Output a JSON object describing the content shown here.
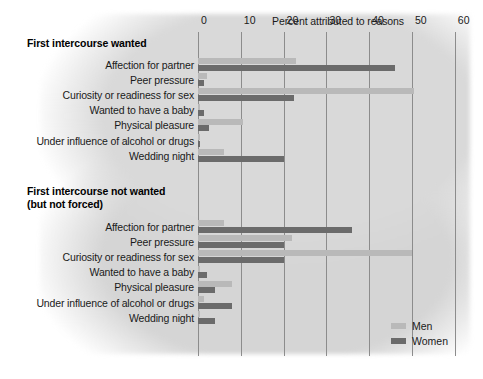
{
  "axis": {
    "title": "Percent attributed to reasons",
    "ticks": [
      0,
      10,
      20,
      30,
      40,
      50,
      60
    ],
    "tick_labels": [
      "0",
      "10",
      "20",
      "30",
      "40",
      "50",
      "60"
    ],
    "xlim": [
      0,
      60
    ]
  },
  "legend": {
    "position": "bottom-right",
    "entries": [
      {
        "label": "Men",
        "color": "#b9b9b9"
      },
      {
        "label": "Women",
        "color": "#6b6b6b"
      }
    ]
  },
  "sections": [
    {
      "title": "First intercourse wanted",
      "title_lines": [
        "First intercourse wanted"
      ]
    },
    {
      "title": "First intercourse not wanted (but not forced)",
      "title_lines": [
        "First intercourse not wanted",
        "(but not forced)"
      ]
    }
  ],
  "categories": [
    "Affection for partner",
    "Peer pressure",
    "Curiosity or readiness for sex",
    "Wanted to have a baby",
    "Physical pleasure",
    "Under influence of alcohol or drugs",
    "Wedding night"
  ],
  "chart_data": {
    "type": "bar",
    "orientation": "horizontal",
    "title": "Percent attributed to reasons",
    "xlabel": "Percent attributed to reasons",
    "ylabel": "",
    "xlim": [
      0,
      60
    ],
    "xticks": [
      0,
      10,
      20,
      30,
      40,
      50,
      60
    ],
    "grid": true,
    "legend_position": "bottom-right",
    "panels": [
      {
        "title": "First intercourse wanted",
        "categories": [
          "Affection for partner",
          "Peer pressure",
          "Curiosity or readiness for sex",
          "Wanted to have a baby",
          "Physical pleasure",
          "Under influence of alcohol or drugs",
          "Wedding night"
        ],
        "series": [
          {
            "name": "Men",
            "color": "#b9b9b9",
            "values": [
              23,
              2,
              50.5,
              0.5,
              10.5,
              0.5,
              6
            ]
          },
          {
            "name": "Women",
            "color": "#6b6b6b",
            "values": [
              46,
              1.5,
              22.5,
              1.5,
              2.5,
              0.5,
              20
            ]
          }
        ]
      },
      {
        "title": "First intercourse not wanted (but not forced)",
        "categories": [
          "Affection for partner",
          "Peer pressure",
          "Curiosity or readiness for sex",
          "Wanted to have a baby",
          "Physical pleasure",
          "Under influence of alcohol or drugs",
          "Wedding night"
        ],
        "series": [
          {
            "name": "Men",
            "color": "#b9b9b9",
            "values": [
              6,
              22,
              50,
              0.5,
              8,
              1.5,
              0.5
            ]
          },
          {
            "name": "Women",
            "color": "#6b6b6b",
            "values": [
              36,
              20,
              20,
              2,
              4,
              8,
              4
            ]
          }
        ]
      }
    ]
  }
}
